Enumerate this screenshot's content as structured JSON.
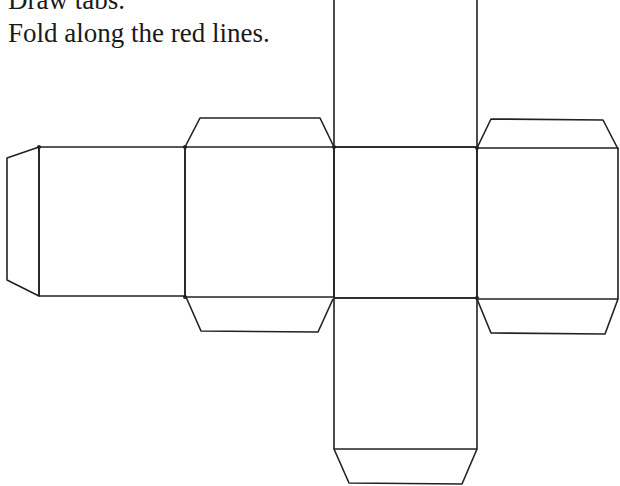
{
  "instructions": {
    "line1": "Draw tabs.",
    "line2": "Fold along the red lines."
  },
  "diagram": {
    "type": "cube-net",
    "faces": 6,
    "tabs": 7,
    "line_color": "#222222",
    "background": "#ffffff"
  }
}
